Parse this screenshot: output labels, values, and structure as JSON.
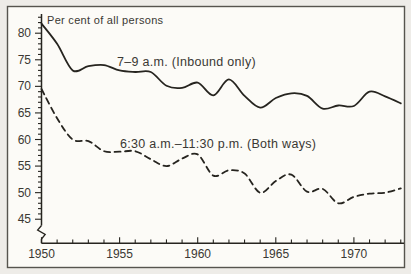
{
  "chart_data": {
    "type": "line",
    "title": "",
    "ylabel": "Per cent of all persons",
    "xlabel": "",
    "x": [
      1950,
      1951,
      1952,
      1953,
      1954,
      1955,
      1956,
      1957,
      1958,
      1959,
      1960,
      1961,
      1962,
      1963,
      1964,
      1965,
      1966,
      1967,
      1968,
      1969,
      1970,
      1971,
      1972,
      1973
    ],
    "series": [
      {
        "name": "7–9 a.m. (Inbound only)",
        "style": "solid",
        "values": [
          81.8,
          78,
          73,
          73.8,
          74,
          73,
          72.7,
          72.7,
          70.1,
          69.7,
          70.7,
          68.3,
          71.3,
          68.2,
          66,
          67.8,
          68.7,
          68.2,
          65.8,
          66.4,
          66.3,
          69,
          68.1,
          66.8
        ]
      },
      {
        "name": "6:30 a.m.–11:30 p.m. (Both ways)",
        "style": "dashed",
        "values": [
          69.5,
          64,
          60,
          59.7,
          57.8,
          57.7,
          57.8,
          56.3,
          55,
          56.4,
          57.2,
          53.2,
          54.2,
          53.6,
          50,
          52.2,
          53.4,
          50.2,
          50.7,
          48,
          49.2,
          49.8,
          50,
          50.8
        ]
      }
    ],
    "y_axis": {
      "min": 45,
      "max": 83,
      "minor_step": 1,
      "labeled": [
        45,
        50,
        55,
        60,
        65,
        70,
        75,
        80
      ],
      "axis_break_at_bottom": true
    },
    "x_axis": {
      "min": 1950,
      "max": 1973,
      "minor_step": 1,
      "labeled": [
        1950,
        1955,
        1960,
        1965,
        1970
      ]
    },
    "ylim": [
      44,
      83.5
    ],
    "xlim": [
      1950,
      1973.3
    ],
    "grid": "off",
    "legend_position": "inline-annotations",
    "colors": {
      "line": "#26241f",
      "text": "#3a3833",
      "paper": "#fcfbf7",
      "margin": "#eeece8",
      "border": "#56544e"
    }
  }
}
